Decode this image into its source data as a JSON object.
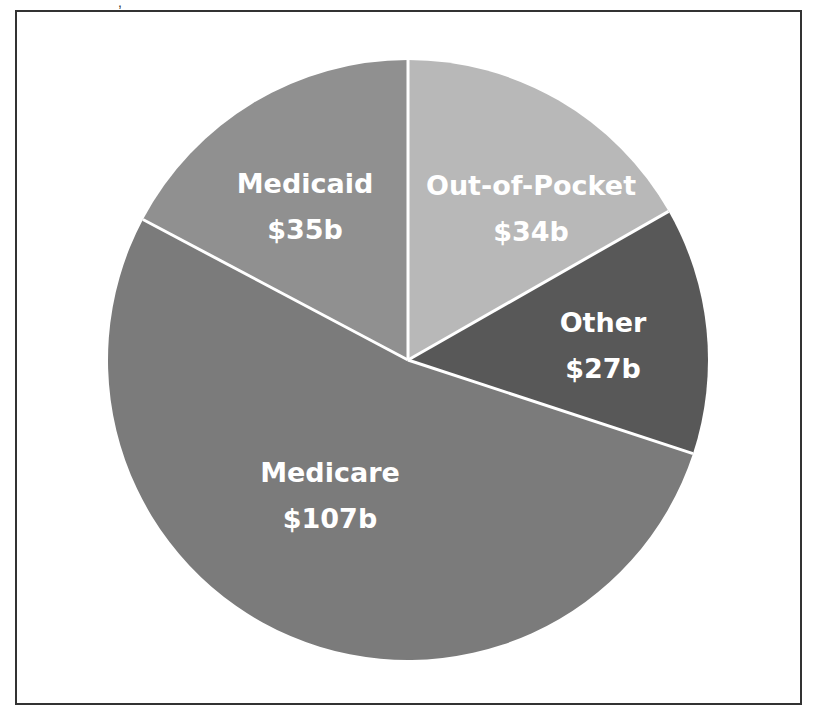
{
  "header": {
    "fragment_text": ","
  },
  "chart_data": {
    "type": "pie",
    "title": "",
    "units": "billions USD",
    "total": 203,
    "start_angle_deg": -90,
    "direction": "clockwise",
    "center": [
      408,
      360
    ],
    "radius": 300,
    "slices": [
      {
        "name": "Out-of-Pocket",
        "value": 34,
        "label": "$34b",
        "color": "#b8b8b8",
        "label_pos": [
          531,
          185
        ]
      },
      {
        "name": "Other",
        "value": 27,
        "label": "$27b",
        "color": "#585858",
        "label_pos": [
          603,
          322
        ]
      },
      {
        "name": "Medicare",
        "value": 107,
        "label": "$107b",
        "color": "#7b7b7b",
        "label_pos": [
          330,
          472
        ]
      },
      {
        "name": "Medicaid",
        "value": 35,
        "label": "$35b",
        "color": "#909090",
        "label_pos": [
          305,
          183
        ]
      }
    ],
    "separator_color": "#ffffff",
    "legend": "none",
    "grid": false
  }
}
